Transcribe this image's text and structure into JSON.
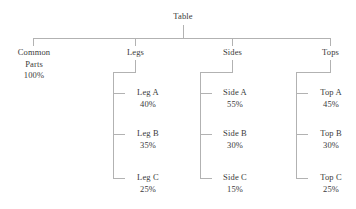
{
  "diagram": {
    "title": "Table",
    "type": "hierarchy-tree",
    "line_color": "#b2b2b2",
    "text_color": "#3a3a3a",
    "background": "#ffffff",
    "root": {
      "label": "Table"
    },
    "level1": [
      {
        "label": "Common Parts",
        "line1": "Common",
        "line2": "Parts",
        "percent": "100%"
      },
      {
        "label": "Legs",
        "percent": ""
      },
      {
        "label": "Sides",
        "percent": ""
      },
      {
        "label": "Tops",
        "percent": ""
      }
    ],
    "legs_children": [
      {
        "label": "Leg A",
        "percent": "40%"
      },
      {
        "label": "Leg B",
        "percent": "35%"
      },
      {
        "label": "Leg C",
        "percent": "25%"
      }
    ],
    "sides_children": [
      {
        "label": "Side A",
        "percent": "55%"
      },
      {
        "label": "Side B",
        "percent": "30%"
      },
      {
        "label": "Side C",
        "percent": "15%"
      }
    ],
    "tops_children": [
      {
        "label": "Top A",
        "percent": "45%"
      },
      {
        "label": "Top B",
        "percent": "30%"
      },
      {
        "label": "Top C",
        "percent": "25%"
      }
    ]
  }
}
